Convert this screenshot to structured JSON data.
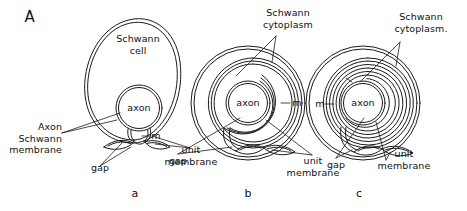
{
  "figure": {
    "panel_letter": "A",
    "background_color": "#ffffff",
    "ink_color": "#1a1a1a"
  },
  "panels": [
    {
      "id": "a",
      "letter": "a",
      "labels": {
        "schwann_cell": "Schwann\ncell",
        "axon": "axon",
        "axon_schwann_membrane": "Axon\nSchwann\nmembrane",
        "gap": "gap",
        "mesaxon": "m",
        "unit_membrane": "unit\nmembrane"
      }
    },
    {
      "id": "b",
      "letter": "b",
      "labels": {
        "schwann_cytoplasm": "Schwann\ncytoplasm",
        "axon": "axon",
        "gap": "gap",
        "mesaxon": "m",
        "unit_membrane": "unit\nmembrane"
      }
    },
    {
      "id": "c",
      "letter": "c",
      "labels": {
        "schwann_cytoplasm": "Schwann\ncytoplasm.",
        "axon": "axon",
        "gap": "gap",
        "mesaxon": "m",
        "unit_membrane": "unit\nmembrane"
      }
    }
  ]
}
